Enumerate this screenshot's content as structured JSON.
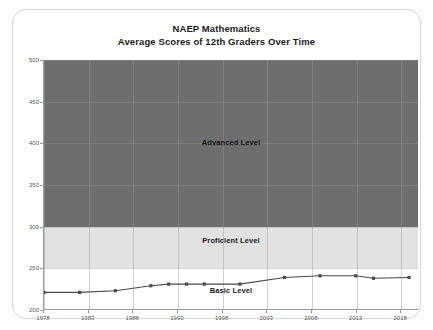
{
  "card": {
    "title_line1": "NAEP Mathematics",
    "title_line2": "Average Scores of 12th Graders Over Time"
  },
  "colors": {
    "advanced_band": "#6e6e6e",
    "proficient_band": "#e2e2e2",
    "basic_band": "#ffffff",
    "line": "#4a4a4a",
    "marker": "#4a4a4a",
    "axis": "#9a9a9a",
    "card_border": "#d6d6d6",
    "title_text": "#1b1b1b",
    "tick_text": "#5a5a5a"
  },
  "chart_data": {
    "type": "line",
    "title": "NAEP Mathematics\nAverage Scores of 12th Graders Over Time",
    "xlabel": "",
    "ylabel": "",
    "xlim": [
      1978,
      2020
    ],
    "ylim": [
      200,
      500
    ],
    "grid": true,
    "legend": "none",
    "yticks": [
      200,
      250,
      300,
      350,
      400,
      450,
      500
    ],
    "xticks": [
      1978,
      1983,
      1988,
      1993,
      1998,
      2003,
      2008,
      2013,
      2018
    ],
    "bands": [
      {
        "name": "Advanced Level",
        "label": "Advanced Level",
        "from": 300,
        "to": 500,
        "color": "#6e6e6e"
      },
      {
        "name": "Proficient Level",
        "label": "Proficient Level",
        "from": 250,
        "to": 300,
        "color": "#e2e2e2"
      },
      {
        "name": "Basic Level",
        "label": "Basic Level",
        "from": 200,
        "to": 250,
        "color": "#ffffff"
      }
    ],
    "series": [
      {
        "name": "Average 12th grade mathematics score",
        "x": [
          1978,
          1982,
          1986,
          1990,
          1992,
          1994,
          1996,
          2000,
          2005,
          2009,
          2013,
          2015,
          2019
        ],
        "values": [
          220,
          220,
          222,
          228,
          230,
          230,
          230,
          230,
          238,
          240,
          240,
          237,
          238
        ]
      }
    ]
  }
}
